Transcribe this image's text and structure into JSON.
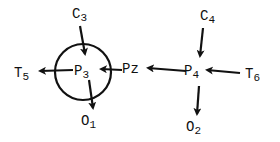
{
  "diagram": {
    "nodes": [
      {
        "id": "C3",
        "base": "C",
        "sub": "3"
      },
      {
        "id": "T5",
        "base": "T",
        "sub": "5"
      },
      {
        "id": "P3",
        "base": "P",
        "sub": "3"
      },
      {
        "id": "O1",
        "base": "O",
        "sub": "1"
      },
      {
        "id": "Pz",
        "base": "Pz",
        "sub": ""
      },
      {
        "id": "C4",
        "base": "C",
        "sub": "4"
      },
      {
        "id": "P4",
        "base": "P",
        "sub": "4"
      },
      {
        "id": "T6",
        "base": "T",
        "sub": "6"
      },
      {
        "id": "O2",
        "base": "O",
        "sub": "2"
      }
    ],
    "edges": [
      {
        "from": "C3",
        "to": "P3"
      },
      {
        "from": "P3",
        "to": "T5"
      },
      {
        "from": "P3",
        "to": "O1"
      },
      {
        "from": "Pz",
        "to": "P3"
      },
      {
        "from": "P4",
        "to": "Pz"
      },
      {
        "from": "C4",
        "to": "P4"
      },
      {
        "from": "T6",
        "to": "P4"
      },
      {
        "from": "P4",
        "to": "O2"
      }
    ],
    "highlight": {
      "node": "P3",
      "shape": "circle"
    },
    "colors": {
      "ink": "#111111",
      "background": "#ffffff"
    }
  }
}
